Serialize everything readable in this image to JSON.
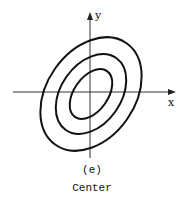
{
  "axes": {
    "x_label": "x",
    "y_label": "y"
  },
  "caption": {
    "letter": "(e)",
    "title": "Center"
  },
  "ellipses": [
    {
      "name": "outer",
      "rx": 62,
      "ry": 44
    },
    {
      "name": "middle",
      "rx": 44,
      "ry": 30
    },
    {
      "name": "inner",
      "rx": 28,
      "ry": 17
    }
  ],
  "colors": {
    "stroke": "#111111",
    "axis": "#333333"
  }
}
